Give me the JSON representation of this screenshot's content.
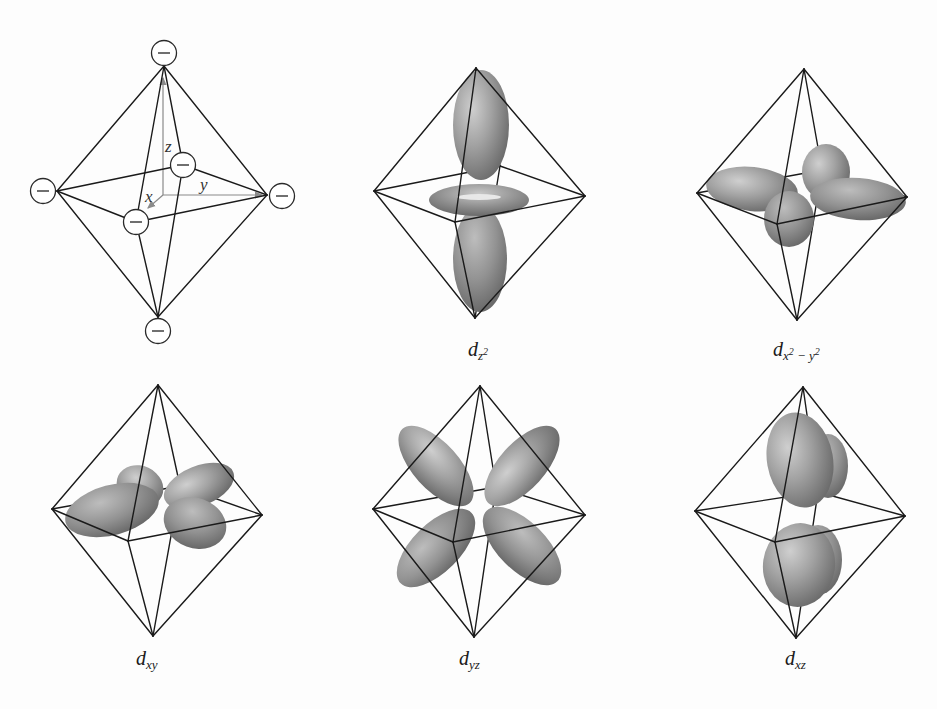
{
  "figure": {
    "panels": [
      {
        "id": "ligands",
        "description": "octahedral arrangement of six negative point charges along the axes",
        "axes": {
          "x": "x",
          "y": "y",
          "z": "z"
        },
        "charge_symbol": "−",
        "charge_count": 6
      },
      {
        "id": "dz2",
        "label_main": "d",
        "label_sub": "z",
        "label_sup": "2"
      },
      {
        "id": "dx2y2",
        "label_main": "d",
        "label_sub_a": "x",
        "label_sup_a": "2",
        "label_sub_mid": " − y",
        "label_sup_b": "2"
      },
      {
        "id": "dxy",
        "label_main": "d",
        "label_sub": "xy"
      },
      {
        "id": "dyz",
        "label_main": "d",
        "label_sub": "yz"
      },
      {
        "id": "dxz",
        "label_main": "d",
        "label_sub": "xz"
      }
    ],
    "colors": {
      "edge": "#1a1a1a",
      "axis": "#8a8a8a",
      "lobe_light": "#c4c4c4",
      "lobe_mid": "#9a9a9a",
      "lobe_dark": "#6b6b6b",
      "background": "#fdfdfd"
    }
  }
}
